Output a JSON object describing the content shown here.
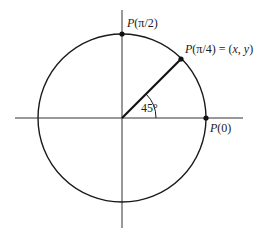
{
  "diagram": {
    "circle": {
      "cx": 122,
      "cy": 118,
      "r": 84
    },
    "axes": {
      "horizontal": {
        "x1": 15,
        "x2": 243,
        "y": 118
      },
      "vertical": {
        "x": 122,
        "y1": 10,
        "y2": 228
      }
    },
    "points": [
      {
        "id": "p-pi-over-2",
        "x": 122,
        "y": 34
      },
      {
        "id": "p-pi-over-4",
        "x": 181,
        "y": 59
      },
      {
        "id": "p-zero",
        "x": 206,
        "y": 118
      }
    ],
    "labels": {
      "p_pi_over_2": {
        "P": "P",
        "arg": "(π/2)"
      },
      "p_pi_over_4": {
        "P": "P",
        "arg": "(π/4)",
        "eq": " = (",
        "x": "x",
        "comma": ", ",
        "y": "y",
        "close": ")"
      },
      "p_zero": {
        "P": "P",
        "arg": "(0)"
      },
      "angle": "45°"
    },
    "angle_arc_radius": 34,
    "colors": {
      "stroke": "#1a1a1a",
      "background": "#ffffff"
    }
  }
}
